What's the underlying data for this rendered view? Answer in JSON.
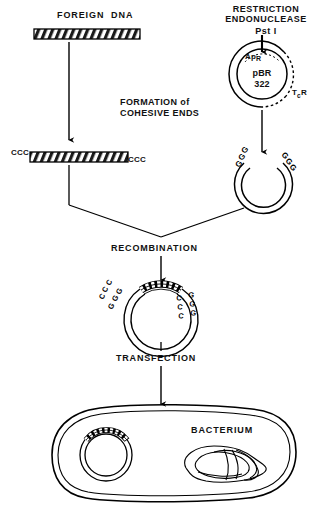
{
  "figure": {
    "type": "diagram",
    "background_color": "#ffffff",
    "line_color": "#000000"
  },
  "labels": {
    "foreign_dna": "FOREIGN  DNA",
    "restriction_enzyme_line1": "RESTRICTION",
    "restriction_enzyme_line2": "ENDONUCLEASE",
    "restriction_enzyme_name": "Pst I",
    "formation_line1": "FORMATION of",
    "formation_line2": "COHESIVE ENDS",
    "recombination": "RECOMBINATION",
    "transfection": "TRANSFECTION",
    "bacterium": "BACTERIUM"
  },
  "plasmid": {
    "name_line1": "pBR",
    "name_line2": "322",
    "marker_ampicillin": "Ap",
    "marker_ampicillin_super": "R",
    "marker_tetracycline": "T",
    "marker_tetracycline_sub": "c",
    "marker_tetracycline_super": "R"
  },
  "sequences": {
    "foreign_end_left": "CCC",
    "foreign_end_right": "CCC",
    "plasmid_end_left": "GGG",
    "plasmid_end_right": "GGG",
    "recombinant_left_top": "CCC",
    "recombinant_left_bottom": "GGG",
    "recombinant_right_top": "CCC",
    "recombinant_right_bottom": "GGG"
  },
  "steps": [
    {
      "id": "foreign-dna",
      "label": "FOREIGN  DNA"
    },
    {
      "id": "restriction-digest",
      "label": "RESTRICTION ENDONUCLEASE Pst I"
    },
    {
      "id": "cohesive-ends",
      "label": "FORMATION of COHESIVE ENDS"
    },
    {
      "id": "recombination",
      "label": "RECOMBINATION"
    },
    {
      "id": "transfection",
      "label": "TRANSFECTION"
    },
    {
      "id": "bacterium",
      "label": "BACTERIUM"
    }
  ]
}
